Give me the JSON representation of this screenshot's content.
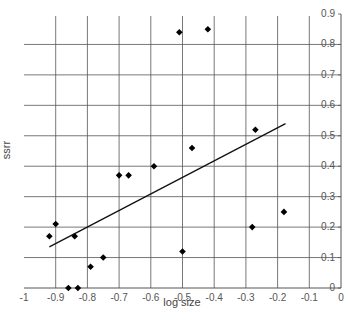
{
  "chart_data": {
    "type": "scatter",
    "title": "",
    "xlabel": "log size",
    "ylabel": "ssrr",
    "xlim": [
      -1,
      0
    ],
    "ylim": [
      0,
      0.9
    ],
    "x_ticks": [
      "-1",
      "-0.9",
      "-0.8",
      "-0.7",
      "-0.6",
      "-0.5",
      "-0.4",
      "-0.3",
      "-0.2",
      "-0.1",
      "0"
    ],
    "y_ticks": [
      "0",
      "0.1",
      "0.2",
      "0.3",
      "0.4",
      "0.5",
      "0.6",
      "0.7",
      "0.8",
      "0.9"
    ],
    "y_axis_position": "right",
    "grid": true,
    "legend": null,
    "series": [
      {
        "name": "ssrr",
        "marker": "diamond",
        "points": [
          {
            "x": -0.92,
            "y": 0.17
          },
          {
            "x": -0.9,
            "y": 0.21
          },
          {
            "x": -0.84,
            "y": 0.17
          },
          {
            "x": -0.86,
            "y": 0.0
          },
          {
            "x": -0.83,
            "y": 0.0
          },
          {
            "x": -0.79,
            "y": 0.07
          },
          {
            "x": -0.75,
            "y": 0.1
          },
          {
            "x": -0.7,
            "y": 0.37
          },
          {
            "x": -0.67,
            "y": 0.37
          },
          {
            "x": -0.59,
            "y": 0.4
          },
          {
            "x": -0.51,
            "y": 0.84
          },
          {
            "x": -0.42,
            "y": 0.85
          },
          {
            "x": -0.47,
            "y": 0.46
          },
          {
            "x": -0.5,
            "y": 0.12
          },
          {
            "x": -0.27,
            "y": 0.52
          },
          {
            "x": -0.28,
            "y": 0.2
          },
          {
            "x": -0.18,
            "y": 0.25
          }
        ]
      }
    ],
    "trendline": {
      "type": "linear",
      "x0": -0.92,
      "y0": 0.135,
      "x1": -0.175,
      "y1": 0.54
    }
  }
}
